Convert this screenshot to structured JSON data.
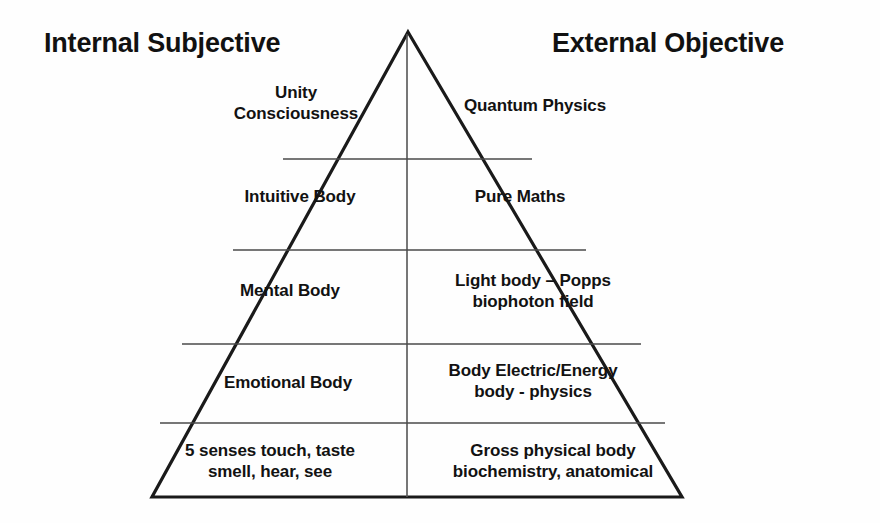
{
  "diagram": {
    "background_color": "#fefefe",
    "line_color": "#1a1a1a",
    "text_color": "#111111"
  },
  "headers": {
    "left": "Internal Subjective",
    "right": "External Objective"
  },
  "levels": [
    {
      "index": 1,
      "left": "Unity\nConsciousness",
      "right": "Quantum Physics"
    },
    {
      "index": 2,
      "left": "Intuitive Body",
      "right": "Pure Maths"
    },
    {
      "index": 3,
      "left": "Mental Body",
      "right": "Light body – Popps\nbiophoton field"
    },
    {
      "index": 4,
      "left": "Emotional Body",
      "right": "Body Electric/Energy\nbody - physics"
    },
    {
      "index": 5,
      "left": "5 senses touch, taste\nsmell, hear, see",
      "right": "Gross physical body\nbiochemistry, anatomical"
    }
  ],
  "geometry": {
    "apex_x": 408,
    "apex_y": 32,
    "base_left_x": 152,
    "base_right_x": 682,
    "base_y": 497,
    "divider_y": [
      159,
      250,
      344,
      423
    ],
    "center_line_x": 407
  }
}
